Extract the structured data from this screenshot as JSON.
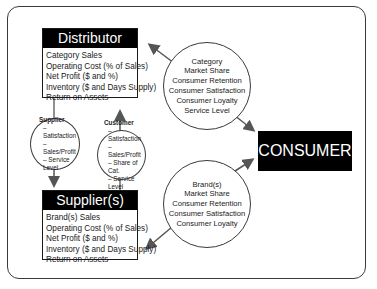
{
  "distributor": {
    "title": "Distributor",
    "metrics": [
      "Category Sales",
      "Operating Cost (% of Sales)",
      "Net Profit ($ and %)",
      "Inventory ($ and Days Supply)",
      "Return on Assets"
    ]
  },
  "suppliers": {
    "title": "Supplier(s)",
    "metrics": [
      "Brand(s) Sales",
      "Operating Cost (% of Sales)",
      "Net Profit ($ and %)",
      "Inventory ($ and Days Supply)",
      "Return on Assets"
    ]
  },
  "consumer": {
    "title": "CONSUMER"
  },
  "category_circle": {
    "lines": [
      "Category",
      "Market Share",
      "Consumer Retention",
      "Consumer Satisfaction",
      "Consumer Loyalty",
      "Service Level"
    ]
  },
  "brand_circle": {
    "lines": [
      "Brand(s)",
      "Market Share",
      "Consumer Retention",
      "Consumer Satisfaction",
      "Consumer Loyalty"
    ]
  },
  "supplier_circle": {
    "title": "Supplier",
    "items": [
      "– Satisfaction",
      "– Sales/Profit",
      "– Service Level"
    ]
  },
  "customer_circle": {
    "title": "Customer",
    "items": [
      "– Satisfaction",
      "– Sales/Profit",
      "– Share of Cat.",
      "– Service Level"
    ]
  },
  "colors": {
    "box_header": "#000000",
    "stroke": "#3a3a3a",
    "arrow": "#555555"
  }
}
